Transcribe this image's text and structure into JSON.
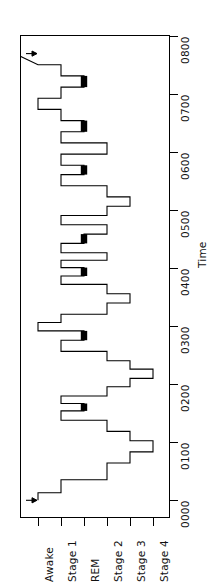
{
  "chart_data": {
    "type": "line",
    "title": "",
    "xlabel": "",
    "ylabel": "Time",
    "orientation": "rotated-90",
    "grid": false,
    "legend": null,
    "stage_axis": {
      "label": "",
      "categories": [
        "Awake",
        "Stage 1",
        "REM",
        "Stage 2",
        "Stage 3",
        "Stage 4"
      ],
      "category_values": [
        0,
        1,
        2,
        3,
        4,
        5
      ]
    },
    "time_axis": {
      "label": "Time",
      "ticks": [
        "0000",
        "0100",
        "0200",
        "0300",
        "0400",
        "0500",
        "0600",
        "0700",
        "0800"
      ],
      "tick_values": [
        0,
        60,
        120,
        180,
        240,
        300,
        360,
        420,
        480
      ],
      "range": [
        -18,
        500
      ]
    },
    "annotations": [
      {
        "name": "lights-off-arrow",
        "time": "0000",
        "stage": "Awake",
        "symbol": "→"
      },
      {
        "name": "lights-on-arrow",
        "time": "0800",
        "stage": "Awake",
        "symbol": "→"
      }
    ],
    "series": [
      {
        "name": "Sleep stage",
        "style": "step",
        "x": [
          0,
          8,
          8,
          22,
          22,
          40,
          40,
          52,
          52,
          64,
          64,
          74,
          74,
          86,
          86,
          96,
          96,
          104,
          104,
          112,
          112,
          122,
          122,
          131,
          131,
          141,
          141,
          150,
          150,
          160,
          160,
          172,
          172,
          182,
          182,
          191,
          191,
          200,
          200,
          212,
          212,
          222,
          222,
          232,
          232,
          241,
          241,
          250,
          250,
          258,
          258,
          266,
          266,
          276,
          276,
          286,
          286,
          296,
          296,
          306,
          306,
          316,
          316,
          326,
          326,
          338,
          338,
          350,
          350,
          360,
          360,
          372,
          372,
          384,
          384,
          396,
          396,
          408,
          408,
          420,
          420,
          432,
          432,
          444,
          444,
          456,
          456,
          468,
          468,
          480
        ],
        "stages": [
          "Awake",
          "Awake",
          "Stage 1",
          "Stage 1",
          "Stage 2",
          "Stage 2",
          "Stage 3",
          "Stage 3",
          "Stage 4",
          "Stage 4",
          "Stage 3",
          "Stage 3",
          "Stage 2",
          "Stage 2",
          "Stage 1",
          "Stage 1",
          "REM",
          "REM",
          "Stage 1",
          "Stage 1",
          "Stage 2",
          "Stage 2",
          "Stage 3",
          "Stage 3",
          "Stage 4",
          "Stage 4",
          "Stage 3",
          "Stage 3",
          "Stage 2",
          "Stage 2",
          "Stage 1",
          "Stage 1",
          "REM",
          "REM",
          "Awake",
          "Awake",
          "Stage 1",
          "Stage 1",
          "Stage 2",
          "Stage 2",
          "Stage 3",
          "Stage 3",
          "Stage 2",
          "Stage 2",
          "Stage 1",
          "Stage 1",
          "REM",
          "REM",
          "Stage 1",
          "Stage 1",
          "Stage 2",
          "Stage 2",
          "Stage 1",
          "Stage 1",
          "REM",
          "REM",
          "Stage 2",
          "Stage 2",
          "Stage 1",
          "Stage 1",
          "Stage 2",
          "Stage 2",
          "Stage 3",
          "Stage 3",
          "Stage 2",
          "Stage 2",
          "Stage 1",
          "Stage 1",
          "REM",
          "REM",
          "Stage 1",
          "Stage 1",
          "Stage 2",
          "Stage 2",
          "Stage 1",
          "Stage 1",
          "REM",
          "REM",
          "Stage 1",
          "Stage 1",
          "Awake",
          "Awake",
          "Stage 1",
          "Stage 1",
          "REM",
          "REM",
          "Stage 1",
          "Stage 1",
          "Awake"
        ]
      }
    ],
    "rem_episodes": [
      {
        "start": 96,
        "end": 104
      },
      {
        "start": 172,
        "end": 182
      },
      {
        "start": 241,
        "end": 250
      },
      {
        "start": 276,
        "end": 286
      },
      {
        "start": 350,
        "end": 360
      },
      {
        "start": 396,
        "end": 408
      },
      {
        "start": 444,
        "end": 456
      }
    ],
    "colors": {
      "trace": "#000000",
      "rem": "#000000",
      "axis": "#000000",
      "background": "#ffffff"
    }
  }
}
